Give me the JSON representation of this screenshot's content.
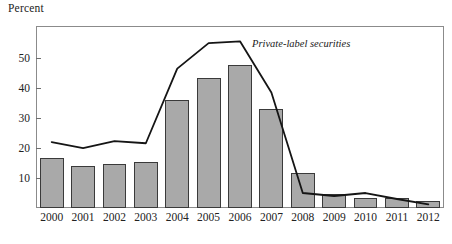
{
  "chart_data": {
    "type": "bar",
    "title": "",
    "ylabel": "Percent",
    "xlabel": "",
    "ylim": [
      0,
      60.7
    ],
    "xlim_categories": [
      "2000",
      "2001",
      "2002",
      "2003",
      "2004",
      "2005",
      "2006",
      "2007",
      "2008",
      "2009",
      "2010",
      "2011",
      "2012"
    ],
    "categories": [
      "2000",
      "2001",
      "2002",
      "2003",
      "2004",
      "2005",
      "2006",
      "2007",
      "2008",
      "2009",
      "2010",
      "2011",
      "2012"
    ],
    "ytick_labels": [
      "10",
      "20",
      "30",
      "40",
      "50"
    ],
    "yticks": [
      10,
      20,
      30,
      40,
      50
    ],
    "grid": false,
    "legend_position": "inline-annotation",
    "series": [
      {
        "name": "Bars",
        "render": "bar",
        "color": "#a9a9a9",
        "edge_color": "#3a3a3a",
        "values": [
          16.6,
          14.0,
          14.7,
          15.3,
          36.0,
          43.5,
          47.8,
          33.0,
          11.7,
          4.7,
          3.3,
          3.5,
          2.3
        ]
      },
      {
        "name": "Private-label securities",
        "render": "line",
        "color": "#151515",
        "values": [
          22.0,
          20.0,
          22.3,
          21.6,
          46.5,
          55.0,
          55.6,
          38.5,
          5.0,
          4.0,
          5.0,
          3.0,
          1.2
        ]
      }
    ],
    "annotations": [
      {
        "text": "Private-label securities",
        "x_category": "2006",
        "y_value": 54.5,
        "style": "italic"
      }
    ]
  },
  "labels": {
    "y_axis_title": "Percent",
    "line_series_label": "Private-label securities"
  }
}
